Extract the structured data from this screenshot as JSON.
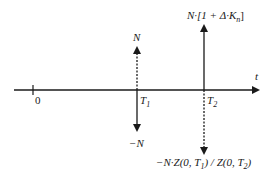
{
  "diagram": {
    "axis_label": "t",
    "origin_label": "0",
    "times": [
      {
        "name": "T",
        "sub": "1"
      },
      {
        "name": "T",
        "sub": "2"
      }
    ],
    "cash_flows": {
      "t1_up": {
        "label": "N",
        "style": "dashed",
        "direction": "up"
      },
      "t1_down": {
        "label": "−N",
        "style": "solid",
        "direction": "down"
      },
      "t2_up": {
        "label_parts": [
          "N·[1 + Δ·K",
          "n",
          "]"
        ],
        "style": "solid",
        "direction": "up"
      },
      "t2_down": {
        "label_parts": [
          "−N·Z(0, T",
          "1",
          ") / Z(0, T",
          "2",
          ")"
        ],
        "style": "dashed",
        "direction": "down"
      }
    },
    "colors": {
      "ink": "#1a1a1a",
      "background": "#ffffff"
    }
  }
}
